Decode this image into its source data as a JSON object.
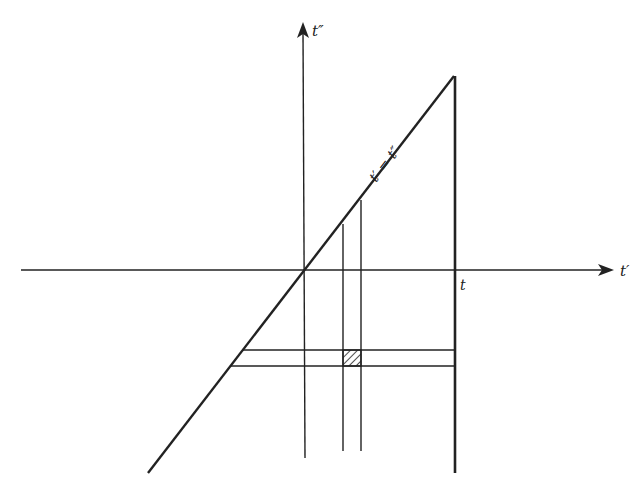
{
  "diagram": {
    "axes": {
      "horizontal_label": "t′",
      "vertical_label": "t″"
    },
    "diagonal_label": "t′ = t″",
    "tick_label_t": "t",
    "colors": {
      "ink": "#222222",
      "background": "#ffffff"
    },
    "elements": {
      "horizontal_axis": {
        "x1": 21,
        "y1": 270,
        "x2": 612,
        "y2": 270
      },
      "vertical_axis": {
        "x1": 305,
        "y1": 458,
        "x2": 303,
        "y2": 24
      },
      "diagonal": {
        "x1": 148,
        "y1": 473,
        "x2": 454,
        "y2": 76
      },
      "right_boundary": {
        "x1": 455,
        "y1": 76,
        "x2": 455,
        "y2": 473
      },
      "vertical_line_a": {
        "x1": 343,
        "y1": 224,
        "x2": 343,
        "y2": 451
      },
      "vertical_line_b": {
        "x1": 361,
        "y1": 200,
        "x2": 361,
        "y2": 451
      },
      "horizontal_line_top": {
        "x1": 243,
        "y1": 350,
        "x2": 455,
        "y2": 350
      },
      "horizontal_line_bottom": {
        "x1": 231,
        "y1": 366,
        "x2": 455,
        "y2": 366
      },
      "hatched_square": {
        "x": 343,
        "y": 350,
        "w": 18,
        "h": 16
      }
    }
  }
}
